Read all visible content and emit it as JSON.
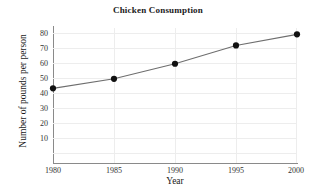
{
  "chart_data": {
    "type": "line",
    "title": "Chicken Consumption",
    "xlabel": "Year",
    "ylabel": "Number of pounds per person",
    "x": [
      1980,
      1985,
      1990,
      1995,
      2000
    ],
    "xtick_labels": [
      "1980",
      "1985",
      "1990",
      "1995",
      "2000"
    ],
    "values": [
      47,
      53,
      62.5,
      74,
      81
    ],
    "ytick_labels": [
      "10",
      "20",
      "30",
      "40",
      "50",
      "60",
      "70",
      "80"
    ],
    "yticks": [
      10,
      20,
      30,
      40,
      50,
      60,
      70,
      80
    ],
    "xlim": [
      1980,
      2000
    ],
    "ylim": [
      0,
      85
    ],
    "grid": true,
    "legend": "none",
    "series": [
      {
        "name": "Chicken consumption",
        "values": [
          47,
          53,
          62.5,
          74,
          81
        ]
      }
    ],
    "colors": {
      "line": "#6e6e6e",
      "marker": "#111111",
      "grid": "#ededed",
      "axis": "#8a8a8a",
      "text": "#1a1a1a",
      "background": "#ffffff"
    }
  }
}
